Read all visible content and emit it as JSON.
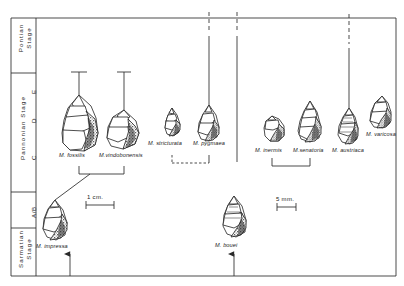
{
  "figure": {
    "type": "stratigraphic-phylogeny-chart"
  },
  "axis": {
    "stages": [
      {
        "id": "pontian",
        "label": "Pontian\nStage"
      },
      {
        "id": "pannonian",
        "label": "Pannonian Stage"
      },
      {
        "id": "sarmatian",
        "label": "Sarmatian\nStage"
      }
    ],
    "pontian_label_line1": "Pontian",
    "pontian_label_line2": "Stage",
    "pannonian_label": "Pannonian Stage",
    "sarmatian_label_line1": "Sarmatian",
    "sarmatian_label_line2": "Stage",
    "zones": [
      {
        "id": "zone-e",
        "label": "E"
      },
      {
        "id": "zone-d",
        "label": "D"
      },
      {
        "id": "zone-c",
        "label": "C"
      },
      {
        "id": "zone-ab",
        "label": "A/B"
      }
    ]
  },
  "taxa": [
    {
      "id": "m-fossilis",
      "label": "M. fossilis"
    },
    {
      "id": "m-vindobonensis",
      "label": "M.vindobonensis"
    },
    {
      "id": "m-stricturata",
      "label": "M. stricturata"
    },
    {
      "id": "m-pygmaea",
      "label": "M. pygmaea"
    },
    {
      "id": "m-inermis",
      "label": "M. inermis"
    },
    {
      "id": "m-senatoria",
      "label": "M.senatoria"
    },
    {
      "id": "m-austriaca",
      "label": "M. austriaca"
    },
    {
      "id": "m-varicosa",
      "label": "M. varicosa"
    },
    {
      "id": "m-impressa",
      "label": "M. impressa"
    },
    {
      "id": "m-bouei",
      "label": "M. bouei"
    }
  ],
  "scalebars": [
    {
      "id": "scale-1cm",
      "label": "1 cm."
    },
    {
      "id": "scale-5mm",
      "label": "5 mm."
    }
  ],
  "colors": {
    "ink": "#1a1a1a",
    "line": "#2a2a2a",
    "aperture_fill": "#3a3a3a",
    "background": "#ffffff"
  }
}
